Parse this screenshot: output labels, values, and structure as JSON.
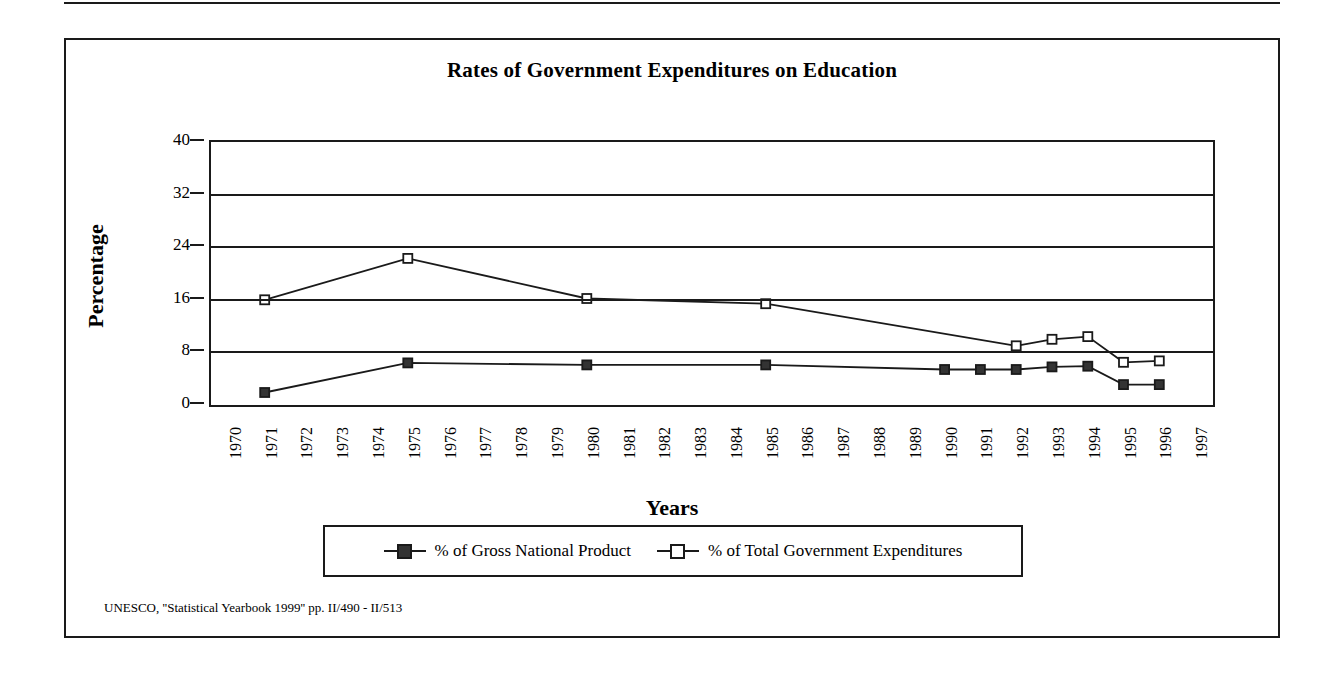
{
  "chart_data": {
    "type": "line",
    "title": "Rates of Government Expenditures on Education",
    "xlabel": "Years",
    "ylabel": "Percentage",
    "ylim": [
      0,
      40
    ],
    "yticks": [
      0,
      8,
      16,
      24,
      32,
      40
    ],
    "grid": true,
    "legend_position": "bottom",
    "categories": [
      "1970",
      "1971",
      "1972",
      "1973",
      "1974",
      "1975",
      "1976",
      "1977",
      "1978",
      "1979",
      "1980",
      "1981",
      "1982",
      "1983",
      "1984",
      "1985",
      "1986",
      "1987",
      "1988",
      "1989",
      "1990",
      "1991",
      "1992",
      "1993",
      "1994",
      "1995",
      "1996",
      "1997"
    ],
    "series": [
      {
        "name": "% of Gross National Product",
        "marker": "filled-square",
        "points": [
          {
            "x": "1971",
            "y": 1.9
          },
          {
            "x": "1975",
            "y": 6.4
          },
          {
            "x": "1980",
            "y": 6.1
          },
          {
            "x": "1985",
            "y": 6.1
          },
          {
            "x": "1990",
            "y": 5.4
          },
          {
            "x": "1991",
            "y": 5.4
          },
          {
            "x": "1992",
            "y": 5.4
          },
          {
            "x": "1993",
            "y": 5.8
          },
          {
            "x": "1994",
            "y": 5.9
          },
          {
            "x": "1995",
            "y": 3.1
          },
          {
            "x": "1996",
            "y": 3.1
          }
        ]
      },
      {
        "name": "% of Total Government Expenditures",
        "marker": "hollow-square",
        "points": [
          {
            "x": "1971",
            "y": 16.0
          },
          {
            "x": "1975",
            "y": 22.3
          },
          {
            "x": "1980",
            "y": 16.2
          },
          {
            "x": "1985",
            "y": 15.4
          },
          {
            "x": "1992",
            "y": 9.0
          },
          {
            "x": "1993",
            "y": 10.0
          },
          {
            "x": "1994",
            "y": 10.4
          },
          {
            "x": "1995",
            "y": 6.5
          },
          {
            "x": "1996",
            "y": 6.7
          }
        ]
      }
    ],
    "source": "UNESCO, ''Statistical Yearbook 1999'' pp. II/490 - II/513"
  },
  "colors": {
    "ink": "#1a1a1a",
    "marker_fill": "#333333",
    "background": "#ffffff"
  }
}
